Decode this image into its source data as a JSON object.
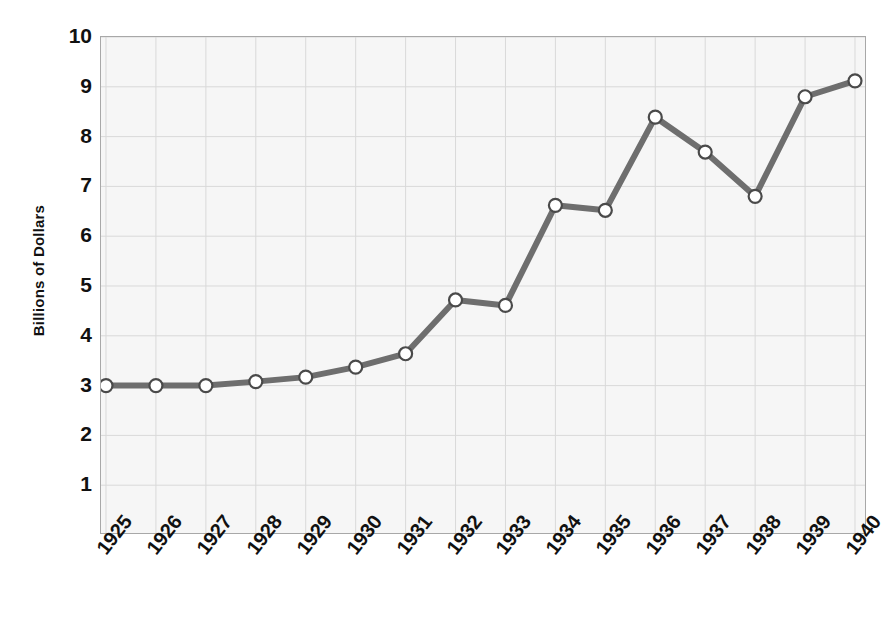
{
  "chart_data": {
    "type": "line",
    "title": "",
    "xlabel": "",
    "ylabel": "Billions of Dollars",
    "categories": [
      "1925",
      "1926",
      "1927",
      "1928",
      "1929",
      "1930",
      "1931",
      "1932",
      "1933",
      "1934",
      "1935",
      "1936",
      "1937",
      "1938",
      "1939",
      "1940"
    ],
    "values": [
      3.0,
      3.0,
      3.0,
      3.08,
      3.17,
      3.37,
      3.64,
      4.72,
      4.61,
      6.62,
      6.52,
      8.39,
      7.69,
      6.8,
      8.8,
      9.12
    ],
    "series": [
      {
        "name": "Billions of Dollars",
        "values": [
          3.0,
          3.0,
          3.0,
          3.08,
          3.17,
          3.37,
          3.64,
          4.72,
          4.61,
          6.62,
          6.52,
          8.39,
          7.69,
          6.8,
          8.8,
          9.12
        ]
      }
    ],
    "ylim": [
      0,
      10
    ],
    "yticks": [
      1,
      2,
      3,
      4,
      5,
      6,
      7,
      8,
      9,
      10
    ],
    "ytick_labels": [
      "1",
      "2",
      "3",
      "4",
      "5",
      "6",
      "7",
      "8",
      "9",
      "10"
    ],
    "grid": true,
    "grid_axis": "both",
    "legend": false,
    "legend_position": "none",
    "marker": "circle-open",
    "line_color": "#6e6e6e",
    "marker_face_color": "#ffffff",
    "marker_edge_color": "#4a4a4a",
    "plot_background": "#f6f6f6",
    "grid_color": "#d9d9d9",
    "axis_border_color": "#a8a8a8",
    "xtick_rotation": -52
  },
  "ghost_text": {
    "lines": [
      "the of",
      "numbered in maximum",
      "minimum for the years",
      "a collateral relation on",
      "where to stated result of",
      "was limiting by extend defined",
      "ordinary procedures of industrial",
      "contract a generally in trade"
    ]
  }
}
